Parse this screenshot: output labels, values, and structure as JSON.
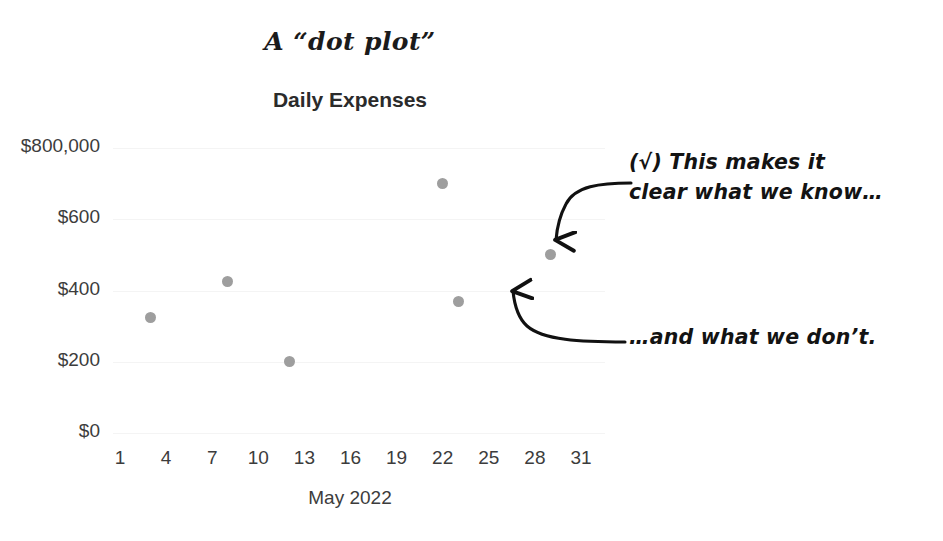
{
  "figure": {
    "caption": "A “dot plot”",
    "chart_title": "Daily Expenses"
  },
  "annotations": {
    "top": "(√) This makes it\nclear what we know…",
    "bottom": "…and what we don’t."
  },
  "colors": {
    "dot": "#9e9e9e",
    "gridline": "#f4f4f4",
    "text": "#3c3c3c",
    "annotation": "#131313",
    "background": "#ffffff"
  },
  "chart_data": {
    "type": "scatter",
    "title": "Daily Expenses",
    "xlabel": "May 2022",
    "ylabel": "",
    "grid": true,
    "legend": false,
    "xlim": [
      1,
      31
    ],
    "ylim": [
      0,
      800
    ],
    "xticks": [
      1,
      4,
      7,
      10,
      13,
      16,
      19,
      22,
      25,
      28,
      31
    ],
    "xticklabels": [
      "1",
      "4",
      "7",
      "10",
      "13",
      "16",
      "19",
      "22",
      "25",
      "28",
      "31"
    ],
    "yticks": [
      0,
      200,
      400,
      600,
      800
    ],
    "yticklabels": [
      "$0",
      "$200",
      "$400",
      "$600",
      "$800,000"
    ],
    "series": [
      {
        "name": "Daily Expenses",
        "color": "#9e9e9e",
        "points": [
          {
            "x": 3,
            "y": 325
          },
          {
            "x": 8,
            "y": 425
          },
          {
            "x": 12,
            "y": 200
          },
          {
            "x": 22,
            "y": 700
          },
          {
            "x": 23,
            "y": 370
          },
          {
            "x": 29,
            "y": 500
          }
        ]
      }
    ]
  }
}
